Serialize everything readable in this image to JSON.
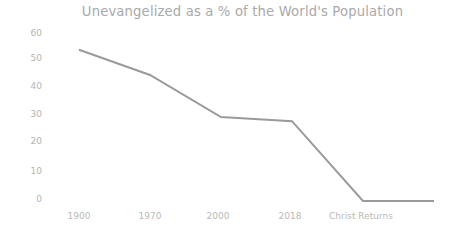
{
  "chart_data": {
    "type": "line",
    "title": "Unevangelized as a % of the World's Population",
    "xlabel": "",
    "ylabel": "",
    "categories": [
      "1900",
      "1970",
      "2000",
      "2018",
      "Christ Returns",
      ""
    ],
    "values": [
      54,
      45,
      30,
      28.5,
      0,
      0
    ],
    "series": [
      {
        "name": "Unevangelized",
        "values": [
          54,
          45,
          30,
          28.5,
          0,
          0
        ],
        "color": "#9a9a9a"
      }
    ],
    "ylim": [
      0,
      60
    ],
    "y_ticks": [
      "60",
      "50",
      "40",
      "30",
      "20",
      "10",
      "0"
    ],
    "y_tick_values": [
      60,
      50,
      40,
      30,
      20,
      10,
      0
    ],
    "x_tick_labels": [
      "1900",
      "1970",
      "2000",
      "2018",
      "Christ Returns"
    ],
    "grid": false,
    "legend": "none",
    "markers": false,
    "line_color": "#9a9a9a",
    "line_width": 2,
    "background_color": "#ffffff",
    "title_color": "#a9a9a9",
    "tick_label_color": "#b6b6b6"
  },
  "axes": {
    "y_labels": [
      {
        "text": "60",
        "top": 28
      },
      {
        "text": "50",
        "top": 53
      },
      {
        "text": "40",
        "top": 81
      },
      {
        "text": "20",
        "top": 136
      },
      {
        "text": "30",
        "top": 109
      },
      {
        "text": "10",
        "top": 166
      },
      {
        "text": "0",
        "top": 194
      }
    ],
    "x_labels": [
      {
        "text": "1900",
        "left": 79
      },
      {
        "text": "1970",
        "left": 150
      },
      {
        "text": "2000",
        "left": 218
      },
      {
        "text": "2018",
        "left": 290
      },
      {
        "text": "Christ Returns",
        "left": 361
      }
    ]
  }
}
